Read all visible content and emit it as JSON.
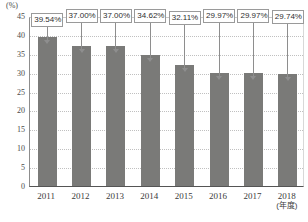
{
  "chart_data": {
    "type": "bar",
    "title": "",
    "subtitle": "",
    "xlabel": "(年度)",
    "ylabel": "(%)",
    "categories": [
      "2011",
      "2012",
      "2013",
      "2014",
      "2015",
      "2016",
      "2017",
      "2018"
    ],
    "values": [
      39.54,
      37.0,
      37.0,
      34.62,
      32.11,
      29.97,
      29.97,
      29.74
    ],
    "data_labels": [
      "39.54%",
      "37.00%",
      "37.00%",
      "34.62%",
      "32.11%",
      "29.97%",
      "29.97%",
      "29.74%"
    ],
    "ylim": [
      0,
      45
    ],
    "ytick_labels": [
      "0",
      "5",
      "10",
      "15",
      "20",
      "25",
      "30",
      "35",
      "40",
      "45"
    ],
    "ytick_values": [
      0,
      5,
      10,
      15,
      20,
      25,
      30,
      35,
      40,
      45
    ],
    "grid": true,
    "legend": false,
    "legend_position": "none",
    "series": [
      {
        "name": "",
        "values": [
          39.54,
          37.0,
          37.0,
          34.62,
          32.11,
          29.97,
          29.97,
          29.74
        ]
      }
    ],
    "colors": {
      "bar": "#7a7a78",
      "grid": "#c0c0c0",
      "axis": "#555555",
      "label_box_border": "#9a9a9a",
      "label_box_fill": "#ffffff",
      "text": "#3b3b3b"
    }
  }
}
